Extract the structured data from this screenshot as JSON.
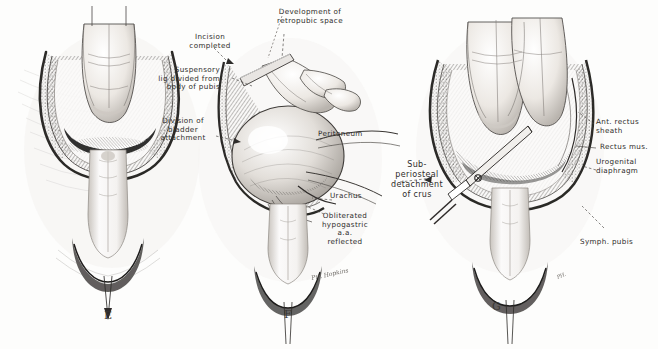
{
  "plate": {
    "title": "Retropubic and perineal dissection sequence",
    "background_color": "#fdfdfc",
    "ink_color": "#2e2c2a",
    "width": 658,
    "height": 349
  },
  "panels": [
    {
      "letter": "E",
      "caption": "E",
      "signature": ""
    },
    {
      "letter": "F",
      "caption": "F",
      "signature": "Ptt. Hopkins"
    },
    {
      "letter": "G",
      "caption": "G",
      "signature": "PH."
    }
  ],
  "labels": [
    {
      "id": "incision-completed",
      "text": "Incision\ncompleted"
    },
    {
      "id": "development-retropubic",
      "text": "Development of\nretropubic space"
    },
    {
      "id": "suspensory-ligament",
      "text": "Suspensory\nlig divided from\nbody of pubis"
    },
    {
      "id": "division-bladder",
      "text": "Division of\nbladder\nattachment"
    },
    {
      "id": "peritoneum",
      "text": "Peritoneum"
    },
    {
      "id": "urachus",
      "text": "Urachus"
    },
    {
      "id": "obliterated-hypogastric",
      "text": "Obliterated\nhypogastric\na.a.\nreflected"
    },
    {
      "id": "sub-periosteal-crus",
      "text": "Sub-\nperiosteal\ndetachment\nof crus"
    },
    {
      "id": "ant-rectus-sheath",
      "text": "Ant. rectus\nsheath"
    },
    {
      "id": "rectus-mus",
      "text": "Rectus mus."
    },
    {
      "id": "urogenital-diaphragm",
      "text": "Urogenital\ndiaphragm"
    },
    {
      "id": "symph-pubis",
      "text": "Symph. pubis"
    }
  ]
}
